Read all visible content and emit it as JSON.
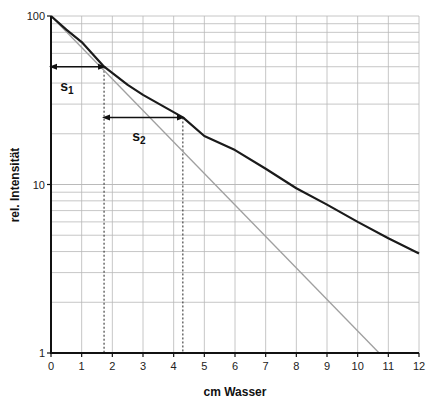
{
  "chart_data": {
    "type": "line",
    "title": "",
    "xlabel": "cm Wasser",
    "ylabel": "rel. Intensität",
    "xlim": [
      0,
      12
    ],
    "ylim": [
      1,
      100
    ],
    "yscale": "log",
    "grid": true,
    "legend": null,
    "x_ticks": [
      "0",
      "1",
      "2",
      "3",
      "4",
      "5",
      "6",
      "7",
      "8",
      "9",
      "10",
      "11",
      "12"
    ],
    "y_ticks": [
      "1",
      "10",
      "100"
    ],
    "series": [
      {
        "name": "gemessene Intensität (Strahlaufhärtung)",
        "color": "#1a1a1a",
        "x": [
          0,
          0.5,
          1,
          1.73,
          2.5,
          3,
          4.3,
          5,
          6,
          7,
          8,
          9,
          10,
          11,
          12
        ],
        "values": [
          100,
          83,
          70,
          50,
          39,
          34,
          25,
          19.4,
          16,
          12.4,
          9.5,
          7.6,
          6.0,
          4.8,
          3.9
        ]
      },
      {
        "name": "monoenergetische Schwächung",
        "color": "#a0a0a0",
        "x": [
          0,
          1.73,
          4.3,
          6.8,
          10.7
        ],
        "values": [
          100,
          68.9,
          39.7,
          23.2,
          10
        ]
      }
    ],
    "annotations": [
      {
        "label": "s",
        "sub": "1",
        "from_x": 0,
        "to_x": 1.73,
        "at_y": 50,
        "text_x": 0.3,
        "text_y": 36
      },
      {
        "label": "s",
        "sub": "2",
        "from_x": 1.73,
        "to_x": 4.3,
        "at_y": 25,
        "text_x": 2.65,
        "text_y": 18
      }
    ],
    "dashed_verticals": [
      1.73,
      4.3
    ]
  }
}
